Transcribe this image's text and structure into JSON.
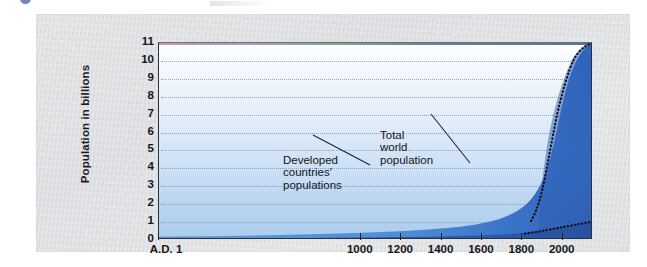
{
  "figure": {
    "y_axis_title": "Population in billions",
    "annotations": {
      "developed": "Developed\ncountries'\npopulations",
      "total": "Total\nworld\npopulation"
    }
  },
  "chart_data": {
    "type": "area",
    "title": "",
    "subtitle": "",
    "xlabel": "",
    "ylabel": "Population in billions",
    "xlim": [
      1,
      2150
    ],
    "ylim": [
      0,
      11
    ],
    "grid": true,
    "legend_position": "inline-annotations",
    "y_ticks": [
      0,
      1,
      2,
      3,
      4,
      5,
      6,
      7,
      8,
      9,
      10,
      11
    ],
    "x_ticks": [
      1,
      1000,
      1200,
      1400,
      1600,
      1800,
      2000
    ],
    "x_tick_labels": [
      "A.D. 1",
      "1000",
      "1200",
      "1400",
      "1600",
      "1800",
      "2000"
    ],
    "annotations": [
      {
        "text": "Developed countries' populations",
        "points_to": "lower band"
      },
      {
        "text": "Total world population",
        "points_to": "upper band"
      }
    ],
    "projection_note": "Stippled (dotted) black boundary marks the projected portion after about 1975",
    "colors": {
      "total_world_population": "#4f8fd6",
      "developed_countries": "#2f64b8",
      "projection_fill": "#2e5fb4",
      "plot_background_top": "#fdfefe",
      "plot_background_bottom": "#accdee",
      "gridline": "#7f93c4",
      "axis": "#2d2f36",
      "card_background": "#e2e3e5"
    },
    "series": [
      {
        "name": "Total world population",
        "x": [
          1,
          200,
          400,
          600,
          800,
          1000,
          1100,
          1200,
          1300,
          1400,
          1500,
          1600,
          1700,
          1750,
          1800,
          1850,
          1900,
          1925,
          1950,
          1960,
          1970,
          1975,
          1980,
          1990,
          2000,
          2010,
          2025,
          2050,
          2075,
          2100,
          2150
        ],
        "values": [
          0.25,
          0.25,
          0.23,
          0.24,
          0.27,
          0.31,
          0.32,
          0.36,
          0.36,
          0.35,
          0.43,
          0.55,
          0.6,
          0.79,
          0.98,
          1.26,
          1.65,
          1.9,
          2.5,
          3.0,
          3.7,
          4.1,
          4.45,
          5.3,
          6.1,
          6.9,
          8.0,
          9.4,
          10.3,
          10.8,
          11.0
        ]
      },
      {
        "name": "Developed countries' populations",
        "x": [
          1,
          400,
          800,
          1000,
          1200,
          1400,
          1600,
          1700,
          1800,
          1850,
          1900,
          1950,
          1975,
          2000,
          2025,
          2050,
          2100,
          2150
        ],
        "values": [
          0.1,
          0.09,
          0.1,
          0.12,
          0.14,
          0.13,
          0.17,
          0.2,
          0.25,
          0.33,
          0.54,
          0.81,
          1.05,
          1.19,
          1.3,
          1.38,
          1.45,
          1.5
        ]
      }
    ]
  }
}
